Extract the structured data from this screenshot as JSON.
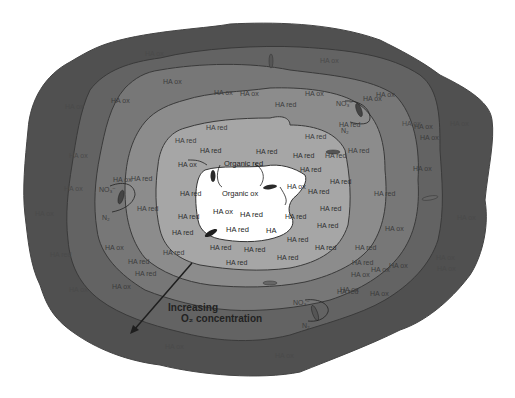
{
  "figure": {
    "type": "concentric-zone-diagram",
    "colors": {
      "background": "#ffffff",
      "zone_outer": "#505050",
      "zone_2": "#636363",
      "zone_3": "#777777",
      "zone_4": "#8c8c8c",
      "zone_5": "#a6a6a6",
      "core": "#ffffff",
      "outline": "#3a3a3a",
      "arrow": "#1e1e1e"
    },
    "annotation": {
      "line1": "Increasing",
      "line2": "O₂ concentration"
    },
    "core_labels": {
      "organic_red": "Organic red",
      "organic_ox": "Organic ox",
      "ha_ox_core": "HA ox",
      "ha_red_core_1": "HA red",
      "ha_red_core_2": "HA red",
      "ha_core": "HA"
    },
    "labels": [
      {
        "text": "HA ox",
        "x": 178,
        "y": 161,
        "cls": "light"
      },
      {
        "text": "HA red",
        "x": 200,
        "y": 147,
        "cls": "light"
      },
      {
        "text": "HA red",
        "x": 256,
        "y": 148,
        "cls": "light"
      },
      {
        "text": "HA red",
        "x": 293,
        "y": 152,
        "cls": "light"
      },
      {
        "text": "HA red",
        "x": 180,
        "y": 190,
        "cls": "light"
      },
      {
        "text": "HA red",
        "x": 178,
        "y": 213,
        "cls": "light"
      },
      {
        "text": "HA red",
        "x": 172,
        "y": 229,
        "cls": "light"
      },
      {
        "text": "HA red",
        "x": 210,
        "y": 244,
        "cls": "light"
      },
      {
        "text": "HA red",
        "x": 244,
        "y": 246,
        "cls": "light"
      },
      {
        "text": "HA red",
        "x": 277,
        "y": 254,
        "cls": "light"
      },
      {
        "text": "HA red",
        "x": 226,
        "y": 259,
        "cls": "light"
      },
      {
        "text": "HA red",
        "x": 315,
        "y": 244,
        "cls": "light"
      },
      {
        "text": "HA red",
        "x": 287,
        "y": 236,
        "cls": "light"
      },
      {
        "text": "HA ox",
        "x": 287,
        "y": 183,
        "cls": "light"
      },
      {
        "text": "HA red",
        "x": 285,
        "y": 213,
        "cls": "light"
      },
      {
        "text": "HA red",
        "x": 308,
        "y": 188,
        "cls": "light"
      },
      {
        "text": "HA red",
        "x": 320,
        "y": 205,
        "cls": "light"
      },
      {
        "text": "HA red",
        "x": 317,
        "y": 222,
        "cls": "light"
      },
      {
        "text": "HA red",
        "x": 330,
        "y": 178,
        "cls": "light"
      },
      {
        "text": "HA red",
        "x": 300,
        "y": 166,
        "cls": "light"
      },
      {
        "text": "HA red",
        "x": 206,
        "y": 124,
        "cls": "mid"
      },
      {
        "text": "HA red",
        "x": 175,
        "y": 137,
        "cls": "mid"
      },
      {
        "text": "HA red",
        "x": 305,
        "y": 133,
        "cls": "mid"
      },
      {
        "text": "HA red",
        "x": 275,
        "y": 101,
        "cls": "mid"
      },
      {
        "text": "HA red",
        "x": 339,
        "y": 121,
        "cls": "mid"
      },
      {
        "text": "HA red",
        "x": 348,
        "y": 147,
        "cls": "mid"
      },
      {
        "text": "HA red",
        "x": 325,
        "y": 152,
        "cls": "mid"
      },
      {
        "text": "HA red",
        "x": 131,
        "y": 175,
        "cls": "mid"
      },
      {
        "text": "HA red",
        "x": 137,
        "y": 205,
        "cls": "mid"
      },
      {
        "text": "HA red",
        "x": 163,
        "y": 249,
        "cls": "mid"
      },
      {
        "text": "HA red",
        "x": 128,
        "y": 258,
        "cls": "mid"
      },
      {
        "text": "HA red",
        "x": 135,
        "y": 270,
        "cls": "mid"
      },
      {
        "text": "HA red",
        "x": 355,
        "y": 244,
        "cls": "mid"
      },
      {
        "text": "HA red",
        "x": 337,
        "y": 288,
        "cls": "mid"
      },
      {
        "text": "HA red",
        "x": 352,
        "y": 259,
        "cls": "mid"
      },
      {
        "text": "HA red",
        "x": 374,
        "y": 190,
        "cls": "mid"
      },
      {
        "text": "HA ox",
        "x": 214,
        "y": 89,
        "cls": "mid"
      },
      {
        "text": "HA ox",
        "x": 240,
        "y": 90,
        "cls": "mid"
      },
      {
        "text": "HA ox",
        "x": 305,
        "y": 90,
        "cls": "mid"
      },
      {
        "text": "HA ox",
        "x": 163,
        "y": 78,
        "cls": "mid"
      },
      {
        "text": "HA ox",
        "x": 111,
        "y": 97,
        "cls": "mid"
      },
      {
        "text": "HA ox",
        "x": 113,
        "y": 176,
        "cls": "mid"
      },
      {
        "text": "HA ox",
        "x": 105,
        "y": 244,
        "cls": "mid"
      },
      {
        "text": "HA ox",
        "x": 112,
        "y": 283,
        "cls": "mid"
      },
      {
        "text": "HA ox",
        "x": 363,
        "y": 95,
        "cls": "mid"
      },
      {
        "text": "HA ox",
        "x": 376,
        "y": 91,
        "cls": "mid"
      },
      {
        "text": "HA ox",
        "x": 414,
        "y": 123,
        "cls": "mid"
      },
      {
        "text": "HA ox",
        "x": 413,
        "y": 165,
        "cls": "mid"
      },
      {
        "text": "HA ox",
        "x": 385,
        "y": 225,
        "cls": "mid"
      },
      {
        "text": "HA ox",
        "x": 389,
        "y": 262,
        "cls": "mid"
      },
      {
        "text": "HA ox",
        "x": 351,
        "y": 271,
        "cls": "mid"
      },
      {
        "text": "HA ox",
        "x": 371,
        "y": 266,
        "cls": "mid"
      },
      {
        "text": "HA ox",
        "x": 340,
        "y": 286,
        "cls": "mid"
      },
      {
        "text": "HA ox",
        "x": 370,
        "y": 290,
        "cls": "mid"
      },
      {
        "text": "HA ox",
        "x": 420,
        "y": 134,
        "cls": "mid"
      },
      {
        "text": "HA ox",
        "x": 145,
        "y": 50,
        "cls": "dark"
      },
      {
        "text": "HA ox",
        "x": 320,
        "y": 57,
        "cls": "dark"
      },
      {
        "text": "HA ox",
        "x": 450,
        "y": 120,
        "cls": "dark"
      },
      {
        "text": "HA ox",
        "x": 457,
        "y": 214,
        "cls": "dark"
      },
      {
        "text": "HA ox",
        "x": 436,
        "y": 254,
        "cls": "dark"
      },
      {
        "text": "HA ox",
        "x": 437,
        "y": 265,
        "cls": "dark"
      },
      {
        "text": "HA ox",
        "x": 69,
        "y": 152,
        "cls": "dark"
      },
      {
        "text": "HA ox",
        "x": 64,
        "y": 185,
        "cls": "dark"
      },
      {
        "text": "HA ox",
        "x": 35,
        "y": 210,
        "cls": "dark"
      },
      {
        "text": "HA red",
        "x": 50,
        "y": 251,
        "cls": "dark"
      },
      {
        "text": "HA ox",
        "x": 69,
        "y": 286,
        "cls": "dark"
      },
      {
        "text": "HA ox",
        "x": 165,
        "y": 343,
        "cls": "dark"
      },
      {
        "text": "HA ox",
        "x": 275,
        "y": 352,
        "cls": "dark"
      },
      {
        "text": "HA ox",
        "x": 65,
        "y": 103,
        "cls": "dark"
      },
      {
        "text": "HA ox",
        "x": 402,
        "y": 120,
        "cls": "dark"
      }
    ],
    "n_cycle_labels": [
      {
        "text": "NO₃⁻",
        "x": 336,
        "y": 100
      },
      {
        "text": "N₂",
        "x": 341,
        "y": 127
      },
      {
        "text": "NO₃⁻",
        "x": 99,
        "y": 186
      },
      {
        "text": "N₂",
        "x": 102,
        "y": 214
      },
      {
        "text": "NO₃⁻",
        "x": 293,
        "y": 299
      },
      {
        "text": "N₂",
        "x": 302,
        "y": 322
      }
    ]
  }
}
